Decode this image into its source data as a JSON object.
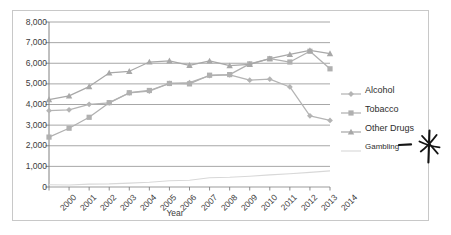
{
  "chart_data": {
    "type": "line",
    "title": "",
    "xlabel": "Year",
    "ylabel": "",
    "categories": [
      "2000",
      "2001",
      "2002",
      "2003",
      "2004",
      "2005",
      "2006",
      "2007",
      "2008",
      "2009",
      "2010",
      "2011",
      "2012",
      "2013",
      "2014"
    ],
    "ylim": [
      0,
      8000
    ],
    "ytick_labels": [
      "8,000",
      "7,000",
      "6,000",
      "5,000",
      "4,000",
      "3,000",
      "2,000",
      "1,000",
      "0"
    ],
    "ytick_values": [
      8000,
      7000,
      6000,
      5000,
      4000,
      3000,
      2000,
      1000,
      0
    ],
    "ystep": 1000,
    "grid": "horizontal",
    "legend_position": "right",
    "series": [
      {
        "name": "Alcohol",
        "marker": "diamond",
        "color": "#b4b4b4",
        "values": [
          3700,
          3740,
          4010,
          4080,
          4560,
          4650,
          5020,
          5060,
          5400,
          5440,
          5180,
          5230,
          4850,
          3450,
          3230
        ]
      },
      {
        "name": "Tobacco",
        "marker": "square",
        "color": "#b0b0b0",
        "values": [
          2420,
          2850,
          3380,
          4090,
          4570,
          4680,
          5020,
          5000,
          5420,
          5450,
          5970,
          6220,
          6060,
          6580,
          5730
        ]
      },
      {
        "name": "Other Drugs",
        "marker": "triangle",
        "color": "#a8a8a8",
        "values": [
          4240,
          4420,
          4870,
          5530,
          5610,
          6060,
          6120,
          5900,
          6110,
          5880,
          5950,
          6220,
          6430,
          6620,
          6470
        ]
      },
      {
        "name": "Gambling",
        "marker": "none",
        "color": "#d8d8d8",
        "values": [
          110,
          100,
          140,
          150,
          190,
          230,
          300,
          330,
          450,
          470,
          520,
          590,
          640,
          710,
          780
        ]
      }
    ]
  },
  "legend": {
    "items": [
      {
        "label": "Alcohol"
      },
      {
        "label": "Tobacco"
      },
      {
        "label": "Other Drugs"
      },
      {
        "label": "Gambling"
      }
    ]
  },
  "annotation": {
    "mark": "hand-drawn-star",
    "points_to": "Gambling"
  },
  "colors": {
    "border": "#c8c8c8",
    "gridline": "#909090",
    "axis": "#808080",
    "text": "#3b3b3b",
    "annotation_ink": "#111111"
  }
}
